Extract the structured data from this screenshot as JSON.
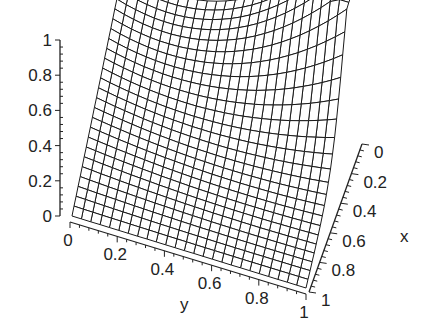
{
  "chart_data": {
    "type": "surface3d",
    "title": "",
    "xlabel": "x",
    "ylabel": "y",
    "zlabel": "",
    "x_ticks": [
      "0",
      "0.2",
      "0.4",
      "0.6",
      "0.8",
      "1"
    ],
    "y_ticks": [
      "0",
      "0.2",
      "0.4",
      "0.6",
      "0.8",
      "1"
    ],
    "z_ticks": [
      "0",
      "0.2",
      "0.4",
      "0.6",
      "0.8",
      "1"
    ],
    "xlim": [
      0,
      1
    ],
    "ylim": [
      0,
      1
    ],
    "zlim": [
      0,
      1
    ],
    "grid_resolution": 25,
    "style": "wireframe",
    "line_color": "#1a1a1a",
    "sample_points": [
      {
        "x": 0,
        "y": 0,
        "z": 0.65
      },
      {
        "x": 0,
        "y": 1,
        "z": 0.65
      },
      {
        "x": 0.1,
        "y": 1,
        "z": 1.0
      },
      {
        "x": 0.5,
        "y": 1,
        "z": 0.45
      },
      {
        "x": 1,
        "y": 1,
        "z": 0.0
      },
      {
        "x": 1,
        "y": 0,
        "z": 0.0
      },
      {
        "x": 0.5,
        "y": 0.5,
        "z": 0.3
      }
    ]
  },
  "labels": {
    "x": "x",
    "y": "y"
  }
}
